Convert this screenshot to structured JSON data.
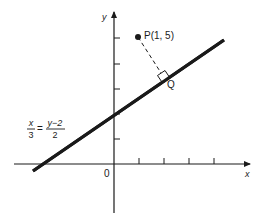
{
  "diagram": {
    "type": "coordinate-geometry",
    "axes": {
      "x_label": "x",
      "y_label": "y",
      "origin_label": "0",
      "x_ticks": [
        1,
        2,
        3,
        4
      ],
      "y_ticks": [
        1,
        2,
        3,
        4,
        5
      ]
    },
    "line": {
      "equation_lhs_num": "x",
      "equation_lhs_den": "3",
      "equation_eq": "=",
      "equation_rhs_num": "y−2",
      "equation_rhs_den": "2",
      "slope_direction": [
        3,
        2
      ],
      "y_intercept": 2
    },
    "point_p": {
      "label": "P(1, 5)",
      "x": 1,
      "y": 5
    },
    "point_q": {
      "label": "Q",
      "description": "foot of perpendicular from P to line"
    },
    "colors": {
      "ink": "#1a1a1a",
      "background": "#ffffff"
    }
  }
}
